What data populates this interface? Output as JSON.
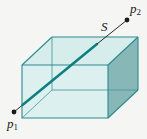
{
  "figure": {
    "background": "#f5f6f4",
    "points": {
      "p1": {
        "base": "p",
        "sub": "1"
      },
      "p2": {
        "base": "p",
        "sub": "2"
      },
      "s": {
        "label": "S"
      }
    },
    "colors": {
      "face_front": "#dcf0ef",
      "face_top": "#d7edec",
      "face_right": "#88b7b8",
      "edge": "#2c8a8c",
      "hidden_edge": "#3f9698",
      "inner_segment": "#0f7e80",
      "outer_line": "#2b2b2b",
      "point_dot": "#1a1a1a",
      "label_text": "#1a1a1a"
    }
  }
}
